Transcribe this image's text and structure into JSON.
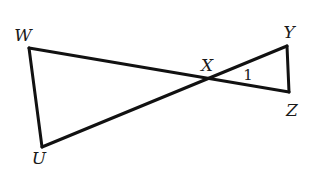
{
  "diagram": {
    "type": "geometry",
    "stroke_color": "#111111",
    "background": "#ffffff",
    "points": {
      "W": {
        "label": "W",
        "x": 29,
        "y": 48,
        "label_x": 23,
        "label_y": 35
      },
      "X": {
        "label": "X",
        "x": 207,
        "y": 79,
        "label_x": 207,
        "label_y": 65
      },
      "Y": {
        "label": "Y",
        "x": 287,
        "y": 46,
        "label_x": 289,
        "label_y": 32
      },
      "Z": {
        "label": "Z",
        "x": 289,
        "y": 92,
        "label_x": 292,
        "label_y": 110
      },
      "U": {
        "label": "U",
        "x": 42,
        "y": 147,
        "label_x": 39,
        "label_y": 158
      }
    },
    "segments": [
      {
        "from": "W",
        "to": "Z"
      },
      {
        "from": "U",
        "to": "Y"
      },
      {
        "from": "W",
        "to": "U"
      },
      {
        "from": "Y",
        "to": "Z"
      }
    ],
    "angle_labels": [
      {
        "label": "1",
        "vertex": "X",
        "x": 248,
        "y": 75
      }
    ]
  }
}
